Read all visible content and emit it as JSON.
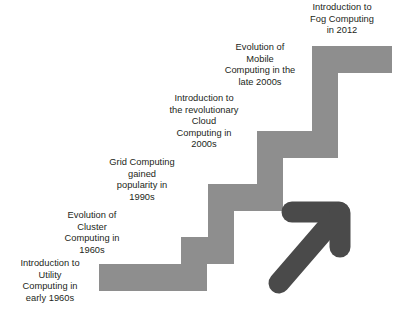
{
  "figure": {
    "name": "evolution-of-computing-paradigms-staircase",
    "background_color": "#ffffff",
    "step_color": "#8e8e8e",
    "arrow_color": "#4a4a4a",
    "text_color": "#231f20"
  },
  "steps": [
    {
      "id": "utility",
      "label": "Introduction to\nUtility\nComputing in\nearly 1960s",
      "order": 1
    },
    {
      "id": "cluster",
      "label": "Evolution of\nCluster\nComputing in\n1960s",
      "order": 2
    },
    {
      "id": "grid",
      "label": "Grid Computing\ngained\npopularity in\n1990s",
      "order": 3
    },
    {
      "id": "cloud",
      "label": "Introduction to\nthe revolutionary\nCloud\nComputing in\n2000s",
      "order": 4
    },
    {
      "id": "mobile",
      "label": "Evolution of\nMobile\nComputing in the\nlate 2000s",
      "order": 5
    },
    {
      "id": "fog",
      "label": "Introduction to\nFog Computing\nin 2012",
      "order": 6
    }
  ],
  "arrow": {
    "name": "growth-arrow",
    "direction": "up-right"
  }
}
